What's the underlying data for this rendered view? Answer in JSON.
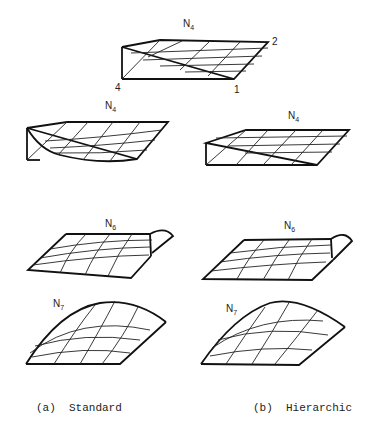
{
  "figure": {
    "top": {
      "label_base": "N",
      "label_sub": "4",
      "corners": {
        "c2": "2",
        "c4": "4",
        "c1": "1"
      }
    },
    "standard": {
      "n4": {
        "label_base": "N",
        "label_sub": "4"
      },
      "n6": {
        "label_base": "N",
        "label_sub": "6"
      },
      "n7": {
        "label_base": "N",
        "label_sub": "7"
      }
    },
    "hierarchic": {
      "n4": {
        "label_base": "N",
        "label_sub": "4"
      },
      "n6": {
        "label_base": "N",
        "label_sub": "6"
      },
      "n7": {
        "label_base": "N",
        "label_sub": "7"
      }
    },
    "captions": {
      "a": "(a)  Standard",
      "b": "(b)  Hierarchic"
    }
  }
}
